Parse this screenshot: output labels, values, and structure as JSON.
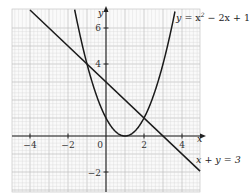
{
  "chart_data": {
    "type": "line",
    "title": "",
    "xlabel": "x",
    "ylabel": "y",
    "xlim": [
      -5,
      5
    ],
    "ylim": [
      -3,
      7
    ],
    "grid": true,
    "x_ticks": [
      -4,
      -2,
      0,
      2,
      4
    ],
    "y_ticks": [
      -2,
      4,
      6
    ],
    "x_tick_labels": [
      "−4",
      "−2",
      "0",
      "2",
      "4"
    ],
    "y_tick_labels": [
      "−2",
      "4",
      "6"
    ],
    "origin_label": "0",
    "series": [
      {
        "name": "y = x² − 2x + 1",
        "kind": "curve",
        "x": [
          -1.6,
          -1,
          0,
          1,
          2,
          3,
          3.6
        ],
        "y": [
          6.76,
          4,
          1,
          0,
          1,
          4,
          6.76
        ]
      },
      {
        "name": "x + y = 3",
        "kind": "line",
        "x": [
          -4.9,
          4.9
        ],
        "y": [
          7.9,
          -1.9
        ]
      }
    ],
    "intersections": [
      {
        "x": -0.79,
        "y": 3.79
      },
      {
        "x": 1.79,
        "y": 1.21
      }
    ],
    "annotations": [
      {
        "text": "y = x² − 2x + 1",
        "position": "top-right"
      },
      {
        "text": "x + y = 3",
        "position": "bottom-right"
      }
    ]
  },
  "labels": {
    "x_axis": "x",
    "y_axis": "y",
    "origin": "0",
    "curve_eq_y": "y",
    "curve_eq_rest": " = x",
    "curve_eq_sup": "2",
    "curve_eq_tail": " − 2x + 1",
    "line_eq": "x + y = 3",
    "tick_x_m4": "−4",
    "tick_x_m2": "−2",
    "tick_x_2": "2",
    "tick_x_4": "4",
    "tick_y_6": "6",
    "tick_y_4": "4",
    "tick_y_m2": "−2"
  },
  "colors": {
    "grid_minor": "#d9d9d9",
    "grid_major": "#bdbdbd",
    "axis": "#222222",
    "curve": "#1a1a1a"
  }
}
